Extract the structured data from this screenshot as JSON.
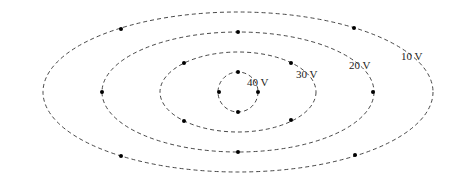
{
  "diagram": {
    "type": "equipotential-lines",
    "center": {
      "x": 238,
      "y": 92
    },
    "line_color": "#333333",
    "dot_color": "#000000",
    "contours": [
      {
        "label": "10 V",
        "rx": 195,
        "ry": 80,
        "label_pos": {
          "x": 401,
          "y": 60
        },
        "dots": [
          {
            "x": 121,
            "y": 29
          },
          {
            "x": 354,
            "y": 28
          },
          {
            "x": 121,
            "y": 156
          },
          {
            "x": 355,
            "y": 155
          }
        ]
      },
      {
        "label": "20 V",
        "rx": 136,
        "ry": 60,
        "label_pos": {
          "x": 349,
          "y": 69
        },
        "dots": [
          {
            "x": 238,
            "y": 32
          },
          {
            "x": 102,
            "y": 92
          },
          {
            "x": 373,
            "y": 92
          },
          {
            "x": 238,
            "y": 152
          }
        ]
      },
      {
        "label": "30 V",
        "rx": 78,
        "ry": 40,
        "label_pos": {
          "x": 296,
          "y": 78
        },
        "dots": [
          {
            "x": 184,
            "y": 63
          },
          {
            "x": 291,
            "y": 63
          },
          {
            "x": 184,
            "y": 121
          },
          {
            "x": 291,
            "y": 120
          }
        ]
      },
      {
        "label": "40 V",
        "rx": 20,
        "ry": 20,
        "label_pos": {
          "x": 247,
          "y": 86
        },
        "dots": [
          {
            "x": 238,
            "y": 72
          },
          {
            "x": 219,
            "y": 92
          },
          {
            "x": 258,
            "y": 92
          },
          {
            "x": 238,
            "y": 112
          }
        ]
      }
    ]
  }
}
